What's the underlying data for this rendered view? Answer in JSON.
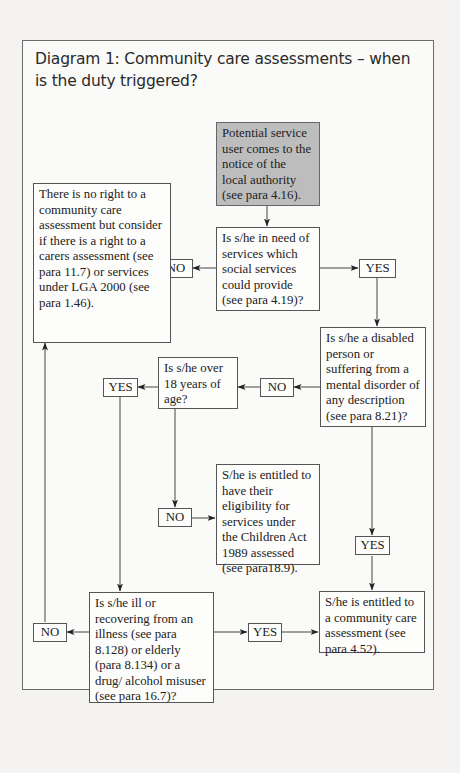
{
  "diagram": {
    "title": "Diagram 1: Community care assessments – when is the duty triggered?",
    "nodes": {
      "start": "Potential service user comes to the notice of the local authority (see para 4.16).",
      "need_services": "Is s/he in need of services which social services could provide (see para 4.19)?",
      "no_right": "There is no right to a community care assessment but consider if there is a right to a carers assessment (see para 11.7) or services under LGA 2000 (see para 1.46).",
      "disabled": "Is s/he a disabled person or suffering from a mental disorder of any description (see para 8.21)?",
      "over_18": "Is s/he over 18 years of age?",
      "children_act": "S/he is entitled to have their eligibility for services under the Children Act 1989 assessed (see para18.9).",
      "ill_elderly": "Is s/he ill or recovering from an illness (see para 8.128) or elderly (para 8.134) or a drug/ alcohol misuser (see para 16.7)?",
      "entitled": "S/he is entitled to a community care assessment (see para 4.52)."
    },
    "labels": {
      "need_no": "NO",
      "need_yes": "YES",
      "disabled_no": "NO",
      "disabled_yes": "YES",
      "over18_yes": "YES",
      "over18_no": "NO",
      "ill_no": "NO",
      "ill_yes": "YES"
    },
    "edges": [
      {
        "from": "start",
        "to": "need_services"
      },
      {
        "from": "need_services",
        "label": "NO",
        "to": "no_right"
      },
      {
        "from": "need_services",
        "label": "YES",
        "to": "disabled"
      },
      {
        "from": "disabled",
        "label": "NO",
        "to": "over_18"
      },
      {
        "from": "disabled",
        "label": "YES",
        "to": "entitled"
      },
      {
        "from": "over_18",
        "label": "YES",
        "to": "ill_elderly"
      },
      {
        "from": "over_18",
        "label": "NO",
        "to": "children_act"
      },
      {
        "from": "ill_elderly",
        "label": "NO",
        "to": "no_right"
      },
      {
        "from": "ill_elderly",
        "label": "YES",
        "to": "entitled"
      }
    ]
  }
}
